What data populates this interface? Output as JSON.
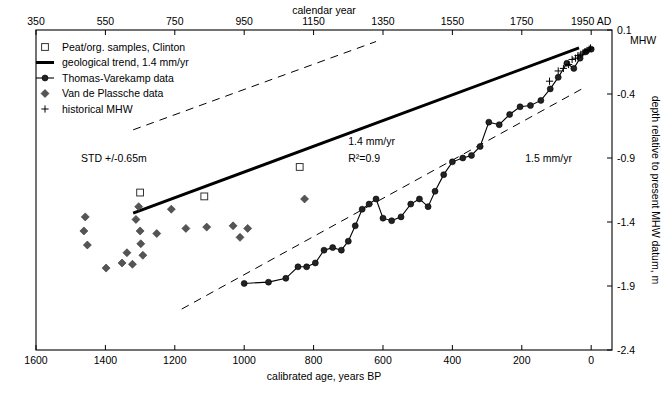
{
  "chart_data": {
    "type": "scatter",
    "title": "",
    "xlabel": "calibrated age, years BP",
    "x_top_label": "calendar year",
    "ylabel": "depth relative to present MHW datum, m",
    "xlim": [
      1600,
      -60
    ],
    "xticks": [
      1600,
      1400,
      1200,
      1000,
      800,
      600,
      400,
      200,
      0
    ],
    "xticklabels": [
      "1600",
      "1400",
      "1200",
      "1000",
      "800",
      "600",
      "400",
      "200",
      "0"
    ],
    "x_top_ticks": [
      1600,
      1400,
      1200,
      1000,
      800,
      600,
      400,
      200,
      0
    ],
    "x_top_ticklabels": [
      "350",
      "550",
      "750",
      "950",
      "1150",
      "1350",
      "1550",
      "1750",
      "1950 AD"
    ],
    "ylim": [
      -2.4,
      0.1
    ],
    "yticks": [
      0.1,
      -0.4,
      -0.9,
      -1.4,
      -1.9,
      -2.4
    ],
    "yticklabels": [
      "0.1",
      "-0.4",
      "-0.9",
      "-1.4",
      "-1.9",
      "-2.4"
    ],
    "right_axis_note": "MHW",
    "grid": false,
    "legend_position": "top-left",
    "legend": [
      {
        "label": "Peat/org. samples, Clinton",
        "marker": "open-square"
      },
      {
        "label": "geological trend, 1.4 mm/yr",
        "marker": "thick-line"
      },
      {
        "label": "Thomas-Varekamp data",
        "marker": "line-filled-circle"
      },
      {
        "label": "Van de Plassche data",
        "marker": "filled-diamond"
      },
      {
        "label": "historical MHW",
        "marker": "plus"
      }
    ],
    "annotations": [
      {
        "text": "STD +/-0.65m",
        "x": 1470,
        "y": -0.93
      },
      {
        "text": "1.4 mm/yr",
        "x": 700,
        "y": -0.8
      },
      {
        "text": "R²=0.9",
        "x": 700,
        "y": -0.93
      },
      {
        "text": "1.5 mm/yr",
        "x": 190,
        "y": -0.93
      }
    ],
    "series": [
      {
        "name": "Peat/org. samples, Clinton",
        "marker": "open-square",
        "points": [
          {
            "x": 1300,
            "y": -1.17
          },
          {
            "x": 1115,
            "y": -1.2
          },
          {
            "x": 840,
            "y": -0.97
          }
        ]
      },
      {
        "name": "Van de Plassche data",
        "marker": "filled-diamond",
        "points": [
          {
            "x": 1458,
            "y": -1.36
          },
          {
            "x": 1462,
            "y": -1.47
          },
          {
            "x": 1452,
            "y": -1.58
          },
          {
            "x": 1398,
            "y": -1.76
          },
          {
            "x": 1352,
            "y": -1.72
          },
          {
            "x": 1338,
            "y": -1.64
          },
          {
            "x": 1322,
            "y": -1.73
          },
          {
            "x": 1312,
            "y": -1.38
          },
          {
            "x": 1304,
            "y": -1.28
          },
          {
            "x": 1300,
            "y": -1.47
          },
          {
            "x": 1298,
            "y": -1.57
          },
          {
            "x": 1292,
            "y": -1.66
          },
          {
            "x": 1252,
            "y": -1.49
          },
          {
            "x": 1210,
            "y": -1.3
          },
          {
            "x": 1168,
            "y": -1.45
          },
          {
            "x": 1108,
            "y": -1.44
          },
          {
            "x": 1032,
            "y": -1.43
          },
          {
            "x": 1012,
            "y": -1.52
          },
          {
            "x": 990,
            "y": -1.45
          },
          {
            "x": 826,
            "y": -1.22
          }
        ]
      },
      {
        "name": "Thomas-Varekamp data",
        "marker": "line-filled-circle",
        "points": [
          {
            "x": 1000,
            "y": -1.88
          },
          {
            "x": 930,
            "y": -1.87
          },
          {
            "x": 880,
            "y": -1.84
          },
          {
            "x": 845,
            "y": -1.75
          },
          {
            "x": 820,
            "y": -1.75
          },
          {
            "x": 795,
            "y": -1.72
          },
          {
            "x": 770,
            "y": -1.62
          },
          {
            "x": 745,
            "y": -1.6
          },
          {
            "x": 720,
            "y": -1.62
          },
          {
            "x": 700,
            "y": -1.55
          },
          {
            "x": 680,
            "y": -1.43
          },
          {
            "x": 660,
            "y": -1.3
          },
          {
            "x": 640,
            "y": -1.26
          },
          {
            "x": 620,
            "y": -1.22
          },
          {
            "x": 600,
            "y": -1.37
          },
          {
            "x": 575,
            "y": -1.39
          },
          {
            "x": 548,
            "y": -1.36
          },
          {
            "x": 520,
            "y": -1.26
          },
          {
            "x": 495,
            "y": -1.22
          },
          {
            "x": 470,
            "y": -1.28
          },
          {
            "x": 450,
            "y": -1.16
          },
          {
            "x": 425,
            "y": -1.03
          },
          {
            "x": 400,
            "y": -0.93
          },
          {
            "x": 370,
            "y": -0.9
          },
          {
            "x": 345,
            "y": -0.88
          },
          {
            "x": 320,
            "y": -0.81
          },
          {
            "x": 295,
            "y": -0.62
          },
          {
            "x": 265,
            "y": -0.64
          },
          {
            "x": 235,
            "y": -0.56
          },
          {
            "x": 205,
            "y": -0.5
          },
          {
            "x": 175,
            "y": -0.49
          },
          {
            "x": 145,
            "y": -0.45
          },
          {
            "x": 118,
            "y": -0.36
          },
          {
            "x": 95,
            "y": -0.27
          },
          {
            "x": 70,
            "y": -0.16
          },
          {
            "x": 50,
            "y": -0.2
          },
          {
            "x": 32,
            "y": -0.12
          },
          {
            "x": 15,
            "y": -0.07
          },
          {
            "x": 0,
            "y": -0.05
          }
        ]
      },
      {
        "name": "historical MHW",
        "marker": "plus",
        "points": [
          {
            "x": 120,
            "y": -0.3
          },
          {
            "x": 95,
            "y": -0.22
          },
          {
            "x": 80,
            "y": -0.2
          },
          {
            "x": 65,
            "y": -0.17
          },
          {
            "x": 55,
            "y": -0.13
          },
          {
            "x": 45,
            "y": -0.12
          },
          {
            "x": 38,
            "y": -0.1
          },
          {
            "x": 30,
            "y": -0.09
          },
          {
            "x": 24,
            "y": -0.08
          },
          {
            "x": 18,
            "y": -0.07
          },
          {
            "x": 12,
            "y": -0.06
          },
          {
            "x": 6,
            "y": -0.05
          },
          {
            "x": 2,
            "y": -0.04
          }
        ]
      }
    ],
    "trend_lines": [
      {
        "name": "geological trend, 1.4 mm/yr",
        "style": "thick-solid",
        "rate_mm_per_yr": 1.4,
        "from": {
          "x": 1320,
          "y": -1.33
        },
        "to": {
          "x": 35,
          "y": -0.04
        }
      },
      {
        "name": "upper STD bound",
        "style": "dashed",
        "from": {
          "x": 1320,
          "y": -0.68
        },
        "to": {
          "x": 620,
          "y": 0.01
        }
      },
      {
        "name": "lower STD bound / 1.5 mm/yr",
        "style": "dashed",
        "from": {
          "x": 1180,
          "y": -2.08
        },
        "to": {
          "x": 20,
          "y": -0.35
        }
      }
    ]
  }
}
